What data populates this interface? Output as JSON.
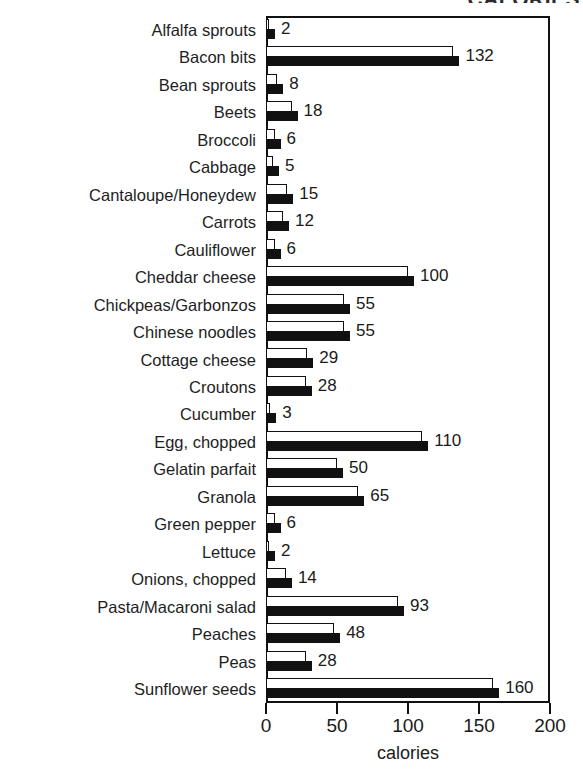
{
  "title_partial": "CALORIES",
  "chart_data": {
    "type": "bar",
    "orientation": "horizontal",
    "title": "CALORIES",
    "xlabel": "calories",
    "ylabel": "",
    "xlim": [
      0,
      200
    ],
    "xticks": [
      0,
      50,
      100,
      150,
      200
    ],
    "grid": false,
    "legend": "none",
    "note": "Each category is drawn as a paired hollow (white outlined) bar above a solid black bar of the same value.",
    "categories": [
      "Alfalfa sprouts",
      "Bacon bits",
      "Bean sprouts",
      "Beets",
      "Broccoli",
      "Cabbage",
      "Cantaloupe/Honeydew",
      "Carrots",
      "Cauliflower",
      "Cheddar cheese",
      "Chickpeas/Garbonzos",
      "Chinese noodles",
      "Cottage cheese",
      "Croutons",
      "Cucumber",
      "Egg, chopped",
      "Gelatin parfait",
      "Granola",
      "Green pepper",
      "Lettuce",
      "Onions, chopped",
      "Pasta/Macaroni salad",
      "Peaches",
      "Peas",
      "Sunflower seeds"
    ],
    "values": [
      2,
      132,
      8,
      18,
      6,
      5,
      15,
      12,
      6,
      100,
      55,
      55,
      29,
      28,
      3,
      110,
      50,
      65,
      6,
      2,
      14,
      93,
      48,
      28,
      160
    ],
    "value_labels": [
      "2",
      "132",
      "8",
      "18",
      "6",
      "5",
      "15",
      "12",
      "6",
      "100",
      "55",
      "55",
      "29",
      "28",
      "3",
      "110",
      "50",
      "65",
      "6",
      "2",
      "14",
      "93",
      "48",
      "28",
      "160"
    ],
    "xticklabels": [
      "0",
      "50",
      "100",
      "150",
      "200"
    ]
  },
  "colors": {
    "bar_fill_solid": "#111111",
    "bar_fill_hollow": "#ffffff",
    "bar_outline": "#111111",
    "axis": "#111111",
    "text": "#1a1a1a",
    "background": "#ffffff"
  }
}
